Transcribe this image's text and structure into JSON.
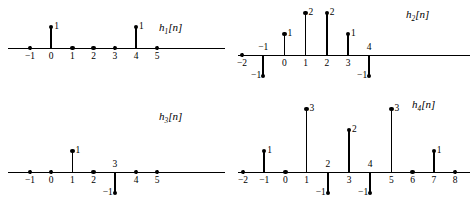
{
  "figure": {
    "background_color": "#ffffff",
    "ink_color": "#000000"
  },
  "chart_data": [
    {
      "type": "bar",
      "plot_id": "h1",
      "title": "h₁[n]",
      "title_base": "h",
      "title_sub": "1",
      "title_arg": "[n]",
      "style": "stem",
      "xlabel": "n",
      "ylabel": "",
      "x": [
        -1,
        0,
        1,
        2,
        3,
        4,
        5
      ],
      "values": [
        0,
        1,
        0,
        0,
        0,
        1,
        0
      ],
      "tick_labels": [
        "−1",
        "0",
        "1",
        "2",
        "3",
        "4",
        "5"
      ],
      "tick_label_side": [
        "below",
        "below",
        "below",
        "below",
        "below",
        "below",
        "below"
      ],
      "value_labels": [
        "",
        "1",
        "",
        "",
        "",
        "1",
        ""
      ],
      "xlim": [
        -1,
        5
      ],
      "ylim": [
        0,
        1
      ],
      "grid": false,
      "legend": "none"
    },
    {
      "type": "bar",
      "plot_id": "h2",
      "title": "h₂[n]",
      "title_base": "h",
      "title_sub": "2",
      "title_arg": "[n]",
      "style": "stem",
      "xlabel": "n",
      "ylabel": "",
      "x": [
        -2,
        -1,
        0,
        1,
        2,
        3,
        4
      ],
      "values": [
        0,
        -1,
        1,
        2,
        2,
        1,
        -1
      ],
      "tick_labels": [
        "−2",
        "−1",
        "0",
        "1",
        "2",
        "3",
        "4"
      ],
      "tick_label_side": [
        "below",
        "above",
        "below",
        "below",
        "below",
        "below",
        "above"
      ],
      "value_labels": [
        "",
        "−1",
        "1",
        "2",
        "2",
        "1",
        "−1"
      ],
      "xlim": [
        -2,
        4
      ],
      "ylim": [
        -1,
        2
      ],
      "grid": false,
      "legend": "none"
    },
    {
      "type": "bar",
      "plot_id": "h3",
      "title": "h₃[n]",
      "title_base": "h",
      "title_sub": "3",
      "title_arg": "[n]",
      "style": "stem",
      "xlabel": "n",
      "ylabel": "",
      "x": [
        -1,
        0,
        1,
        2,
        3,
        4,
        5
      ],
      "values": [
        0,
        0,
        1,
        0,
        -1,
        0,
        0
      ],
      "tick_labels": [
        "−1",
        "0",
        "1",
        "2",
        "3",
        "4",
        "5"
      ],
      "tick_label_side": [
        "below",
        "below",
        "below",
        "below",
        "above",
        "below",
        "below"
      ],
      "value_labels": [
        "",
        "",
        "1",
        "",
        "−1",
        "",
        ""
      ],
      "xlim": [
        -1,
        5
      ],
      "ylim": [
        -1,
        1
      ],
      "grid": false,
      "legend": "none"
    },
    {
      "type": "bar",
      "plot_id": "h4",
      "title": "h₄[n]",
      "title_base": "h",
      "title_sub": "4",
      "title_arg": "[n]",
      "style": "stem",
      "xlabel": "n",
      "ylabel": "",
      "x": [
        -2,
        -1,
        0,
        1,
        2,
        3,
        4,
        5,
        6,
        7,
        8
      ],
      "values": [
        0,
        1,
        0,
        3,
        -1,
        2,
        -1,
        3,
        0,
        1,
        0
      ],
      "tick_labels": [
        "−2",
        "−1",
        "0",
        "1",
        "2",
        "3",
        "4",
        "5",
        "6",
        "7",
        "8"
      ],
      "tick_label_side": [
        "below",
        "below",
        "below",
        "below",
        "above",
        "below",
        "above",
        "below",
        "below",
        "below",
        "below"
      ],
      "value_labels": [
        "",
        "1",
        "",
        "3",
        "−1",
        "2",
        "−1",
        "3",
        "",
        "1",
        ""
      ],
      "xlim": [
        -2,
        8
      ],
      "ylim": [
        -1,
        3
      ],
      "grid": false,
      "legend": "none"
    }
  ]
}
